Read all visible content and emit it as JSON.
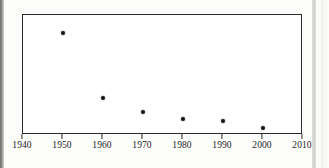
{
  "figure": {
    "background_color": "#fcfcfb",
    "frame_color": "#2b2b2b",
    "marker_color": "#141414"
  },
  "chart_data": {
    "type": "scatter",
    "title": "",
    "subtitle": "",
    "xlabel": "",
    "ylabel": "",
    "xlim": [
      1940,
      2010
    ],
    "ylim": [
      0,
      1
    ],
    "grid": false,
    "legend": null,
    "xticks": [
      1940,
      1950,
      1960,
      1970,
      1980,
      1990,
      2000,
      2010
    ],
    "xtick_labels": [
      "1940",
      "1950",
      "1960",
      "1970",
      "1980",
      "1990",
      "2000",
      "2010"
    ],
    "yticks": [],
    "ytick_labels": [],
    "x": [
      1950,
      1960,
      1970,
      1980,
      1990,
      2000
    ],
    "values": [
      0.85,
      0.31,
      0.19,
      0.13,
      0.12,
      0.06
    ],
    "points": [
      {
        "x": 1950,
        "y": 0.85
      },
      {
        "x": 1960,
        "y": 0.31
      },
      {
        "x": 1970,
        "y": 0.19
      },
      {
        "x": 1980,
        "y": 0.13
      },
      {
        "x": 1990,
        "y": 0.12
      },
      {
        "x": 2000,
        "y": 0.06
      }
    ],
    "annotations": []
  }
}
